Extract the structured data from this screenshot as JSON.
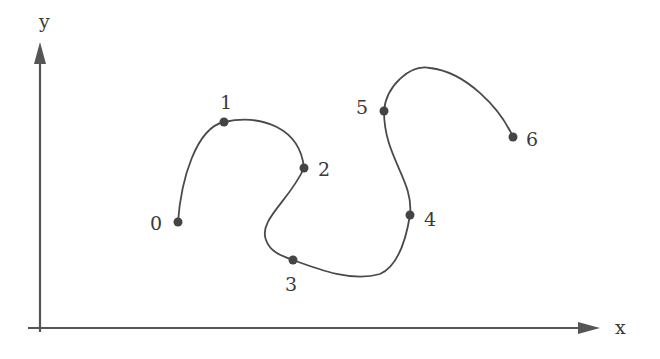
{
  "axes": {
    "x_label": "x",
    "y_label": "y",
    "color": "#555555"
  },
  "curve": {
    "color": "#4a4a4a",
    "point_color": "#444444",
    "type": "interpolating spline through control points"
  },
  "points": [
    {
      "label": "0",
      "x": 178,
      "y": 222
    },
    {
      "label": "1",
      "x": 224,
      "y": 122
    },
    {
      "label": "2",
      "x": 304,
      "y": 168
    },
    {
      "label": "3",
      "x": 293,
      "y": 260
    },
    {
      "label": "4",
      "x": 410,
      "y": 215
    },
    {
      "label": "5",
      "x": 384,
      "y": 111
    },
    {
      "label": "6",
      "x": 513,
      "y": 137
    }
  ]
}
